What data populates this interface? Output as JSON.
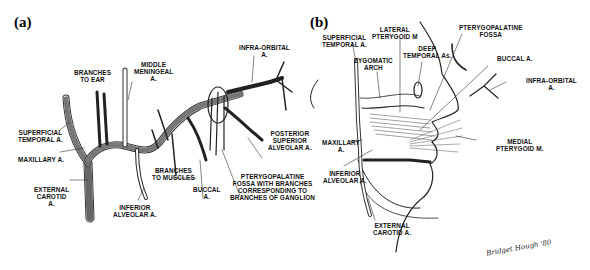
{
  "figure": {
    "panel_a": {
      "tag": "(a)",
      "labels": {
        "superficial_temporal": "SUPERFICIAL\nTEMPORAL A.",
        "maxillary": "MAXILLARY A.",
        "external_carotid": "EXTERNAL\nCAROTID\nA.",
        "branches_to_ear": "BRANCHES\nTO EAR",
        "middle_meningeal": "MIDDLE\nMENINGEAL\nA.",
        "inferior_alveolar": "INFERIOR\nALVEOLAR A.",
        "branches_to_muscles": "BRANCHES\nTO MUSCLES",
        "buccal": "BUCCAL\nA.",
        "pterygopalatine_fossa": "PTERYGOPALATINE\nFOSSA WITH BRANCHES\nCORRESPONDING TO\nBRANCHES OF GANGLION",
        "posterior_superior_alveolar": "POSTERIOR\nSUPERIOR\nALVEOLAR A.",
        "infra_orbital": "INFRA-ORBITAL\nA."
      }
    },
    "panel_b": {
      "tag": "(b)",
      "labels": {
        "superficial_temporal": "SUPERFICIAL\nTEMPORAL A.",
        "lateral_pterygoid": "LATERAL\nPTERYGOID M",
        "zygomatic_arch": "ZYGOMATIC\nARCH",
        "deep_temporal": "DEEP\nTEMPORAL As.",
        "pterygopalatine_fossa": "PTERYGOPALATINE\nFOSSA",
        "buccal": "BUCCAL A.",
        "infra_orbital": "INFRA-ORBITAL\nA.",
        "medial_pterygoid": "MEDIAL\nPTERYGOID M.",
        "maxillary": "MAXILLARY\nA.",
        "inferior_alveolar": "INFERIOR\nALVEOLAR A.",
        "external_carotid": "EXTERNAL\nCAROTID A."
      },
      "signature": "Bridget Hough '80"
    }
  }
}
